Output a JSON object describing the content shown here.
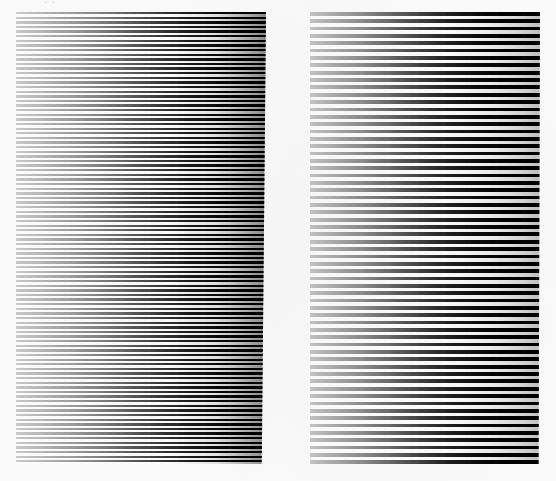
{
  "artwork": {
    "title": "Two-panel horizontal line grating plate",
    "medium": "scanned print on white paper",
    "background_color": "#fdfdfd",
    "ink_color": "#000000",
    "annotation": {
      "label": "pencil-mark",
      "text": "· ·",
      "color": "#5a5a5f"
    }
  },
  "panels": [
    {
      "id": "panel-left",
      "name": "left-grating-panel",
      "caption": "",
      "x": 16,
      "y": 12,
      "width": 250,
      "height": 452,
      "line_orientation": "horizontal",
      "line_pitch_px": 4.62,
      "line_weight_px": 2.35,
      "line_count": 98,
      "gradient_direction": "left-to-right",
      "density_left_pct": 18,
      "density_right_pct": 96,
      "edge_slant": "right edge leans inward toward bottom"
    },
    {
      "id": "panel-right",
      "name": "right-grating-panel",
      "caption": "",
      "x": 310,
      "y": 12,
      "width": 230,
      "height": 452,
      "line_orientation": "horizontal",
      "line_pitch_px": 7.35,
      "line_weight_px": 3.75,
      "line_count": 62,
      "gradient_direction": "left-to-right",
      "density_left_pct": 20,
      "density_right_pct": 52,
      "edge_slant": "right edge very slightly inward toward bottom"
    }
  ],
  "chart_data": {
    "type": "line",
    "subtitle": "",
    "xlabel": "",
    "ylabel": "",
    "grid": false,
    "legend_position": "none",
    "x": [
      0,
      10,
      20,
      30,
      40,
      50,
      60,
      70,
      80,
      90,
      100
    ],
    "series": [
      {
        "name": "left panel ink coverage (%)",
        "values": [
          18,
          22,
          28,
          34,
          42,
          52,
          63,
          74,
          85,
          93,
          96
        ]
      },
      {
        "name": "right panel ink coverage (%)",
        "values": [
          20,
          23,
          26,
          29,
          33,
          37,
          41,
          45,
          48,
          51,
          52
        ]
      }
    ],
    "xlim": [
      0,
      100
    ],
    "ylim": [
      0,
      100
    ],
    "annotations": []
  }
}
